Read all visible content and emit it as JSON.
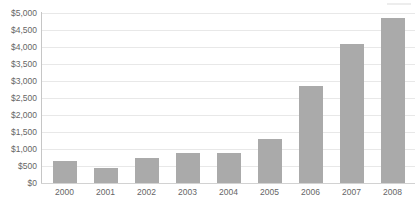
{
  "artifact": {
    "top_crop_text": " "
  },
  "chart_data": {
    "type": "bar",
    "title": "",
    "subtitle": "",
    "xlabel": "",
    "ylabel": "",
    "categories": [
      "2000",
      "2001",
      "2002",
      "2003",
      "2004",
      "2005",
      "2006",
      "2007",
      "2008"
    ],
    "values": [
      640,
      430,
      750,
      870,
      870,
      1300,
      2850,
      4100,
      4850
    ],
    "series": [
      {
        "name": "",
        "values": [
          640,
          430,
          750,
          870,
          870,
          1300,
          2850,
          4100,
          4850
        ]
      }
    ],
    "ylim": [
      0,
      5000
    ],
    "ytick_step": 500,
    "ytick_labels": [
      "$5,000",
      "$4,500",
      "$4,000",
      "$3,500",
      "$3,000",
      "$2,500",
      "$2,000",
      "$1,500",
      "$1,000",
      "$500",
      "$0"
    ],
    "ytick_values": [
      5000,
      4500,
      4000,
      3500,
      3000,
      2500,
      2000,
      1500,
      1000,
      500,
      0
    ],
    "grid": true,
    "grid_axis": "y",
    "legend": false,
    "legend_position": "none",
    "value_prefix": "$",
    "annotations": [],
    "colors": {
      "bar": "#aaaaaa",
      "gridline": "#e8e8e8",
      "axis": "#c6c6c6",
      "text": "#666666",
      "background": "#ffffff"
    }
  }
}
